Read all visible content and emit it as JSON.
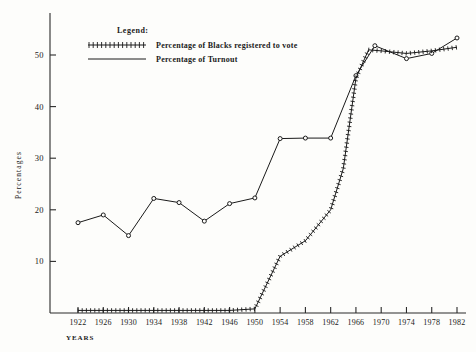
{
  "chart_data": {
    "type": "line",
    "title": "",
    "xlabel": "YEARS",
    "ylabel": "Percentages",
    "xlim": [
      1922,
      1982
    ],
    "ylim": [
      0,
      57
    ],
    "yticks": [
      10,
      20,
      30,
      40,
      50
    ],
    "xticks": [
      1922,
      1926,
      1930,
      1934,
      1938,
      1942,
      1946,
      1950,
      1954,
      1958,
      1962,
      1966,
      1970,
      1974,
      1978,
      1982
    ],
    "grid": false,
    "legend_position": "top-left-inside",
    "legend_title": "Legend:",
    "series": [
      {
        "name": "Percentage of Blacks registered to vote",
        "marker": "cross-hatched-line",
        "x": [
          1922,
          1926,
          1930,
          1934,
          1938,
          1942,
          1946,
          1950,
          1954,
          1958,
          1962,
          1964,
          1966,
          1968,
          1970,
          1974,
          1978,
          1982
        ],
        "values": [
          0.5,
          0.5,
          0.5,
          0.5,
          0.5,
          0.5,
          0.5,
          0.8,
          11.0,
          14.0,
          20.0,
          28.0,
          45.5,
          51.0,
          50.8,
          50.3,
          50.8,
          51.5
        ]
      },
      {
        "name": "Percentage of Turnout",
        "marker": "open-circle-line",
        "x": [
          1922,
          1926,
          1930,
          1934,
          1938,
          1942,
          1946,
          1950,
          1954,
          1958,
          1962,
          1966,
          1969,
          1974,
          1978,
          1982
        ],
        "values": [
          17.5,
          19.0,
          15.0,
          22.2,
          21.4,
          17.8,
          21.2,
          22.3,
          33.8,
          33.9,
          33.9,
          46.0,
          51.8,
          49.3,
          50.3,
          53.3
        ]
      }
    ]
  },
  "legend": {
    "title": "Legend:",
    "entries": [
      {
        "label": "Percentage of Blacks registered to vote",
        "symbol": "cross-hatched-line"
      },
      {
        "label": "Percentage of Turnout",
        "symbol": "plain-line"
      }
    ]
  },
  "axes": {
    "y_title": "Percentages",
    "x_title": "YEARS",
    "y_tick_labels": [
      "50",
      "40",
      "30",
      "20",
      "10"
    ],
    "x_tick_labels": [
      "1922",
      "1926",
      "1930",
      "1934",
      "1938",
      "1942",
      "1946",
      "1950",
      "1954",
      "1958",
      "1962",
      "1966",
      "1970",
      "1974",
      "1978",
      "1982"
    ]
  },
  "colors": {
    "ink": "#1a1a1a",
    "paper": "#fdfdfb"
  }
}
